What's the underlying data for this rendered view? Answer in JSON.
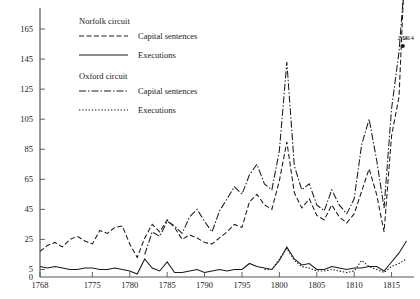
{
  "chart_data": {
    "type": "line",
    "title": "",
    "xlabel": "",
    "ylabel": "",
    "xlim": [
      1768,
      1818
    ],
    "ylim": [
      0,
      175
    ],
    "grid": false,
    "legend_position": "top-left",
    "x_ticks": [
      1768,
      1775,
      1780,
      1785,
      1790,
      1795,
      1800,
      1805,
      1810,
      1815
    ],
    "y_ticks": [
      0,
      5,
      25,
      45,
      65,
      85,
      105,
      125,
      145,
      165
    ],
    "x": [
      1768,
      1769,
      1770,
      1771,
      1772,
      1773,
      1774,
      1775,
      1776,
      1777,
      1778,
      1779,
      1780,
      1781,
      1782,
      1783,
      1784,
      1785,
      1786,
      1787,
      1788,
      1789,
      1790,
      1791,
      1792,
      1793,
      1794,
      1795,
      1796,
      1797,
      1798,
      1799,
      1800,
      1801,
      1802,
      1803,
      1804,
      1805,
      1806,
      1807,
      1808,
      1809,
      1810,
      1811,
      1812,
      1813,
      1814,
      1815,
      1816,
      1817
    ],
    "series": [
      {
        "name": "Capital sentences",
        "circuit": "Norfolk",
        "style": "dashed",
        "values": [
          17,
          21,
          23,
          20,
          25,
          27,
          24,
          22,
          31,
          29,
          33,
          34,
          22,
          13,
          26,
          35,
          30,
          38,
          33,
          25,
          28,
          26,
          23,
          22,
          26,
          30,
          35,
          33,
          50,
          55,
          48,
          45,
          64,
          90,
          56,
          46,
          52,
          41,
          38,
          48,
          40,
          36,
          42,
          57,
          72,
          55,
          30,
          94,
          120,
          234
        ]
      },
      {
        "name": "Executions",
        "circuit": "Norfolk",
        "style": "solid",
        "values": [
          7,
          6,
          7,
          6,
          5,
          5,
          6,
          6,
          5,
          5,
          6,
          5,
          4,
          2,
          12,
          6,
          4,
          10,
          3,
          3,
          4,
          5,
          3,
          4,
          5,
          4,
          5,
          5,
          9,
          7,
          6,
          5,
          11,
          20,
          12,
          8,
          9,
          5,
          5,
          7,
          6,
          5,
          6,
          6,
          7,
          7,
          4,
          10,
          16,
          24
        ]
      },
      {
        "name": "Capital sentences",
        "circuit": "Oxford",
        "style": "dashdot",
        "values": [
          null,
          null,
          null,
          null,
          null,
          null,
          null,
          null,
          null,
          null,
          null,
          null,
          null,
          null,
          15,
          30,
          27,
          37,
          34,
          29,
          40,
          45,
          37,
          30,
          44,
          52,
          60,
          55,
          68,
          75,
          62,
          58,
          84,
          143,
          74,
          58,
          62,
          48,
          44,
          58,
          48,
          42,
          52,
          88,
          105,
          78,
          46,
          112,
          150,
          214
        ]
      },
      {
        "name": "Executions",
        "circuit": "Oxford",
        "style": "dotted",
        "values": [
          null,
          null,
          null,
          null,
          null,
          null,
          null,
          null,
          null,
          null,
          null,
          null,
          null,
          null,
          null,
          null,
          null,
          null,
          null,
          null,
          null,
          null,
          null,
          null,
          null,
          null,
          null,
          null,
          null,
          null,
          5,
          5,
          12,
          19,
          11,
          7,
          6,
          4,
          4,
          5,
          4,
          3,
          4,
          11,
          7,
          5,
          3,
          7,
          9,
          12
        ]
      }
    ],
    "annotations": [
      {
        "label": "234",
        "x": 1816.5,
        "y": 234,
        "series": "Norfolk capital sentences"
      },
      {
        "label": "214",
        "x": 1817.3,
        "y": 214,
        "series": "Oxford capital sentences"
      }
    ]
  },
  "legend": {
    "groups": [
      {
        "title": "Norfolk circuit",
        "entries": [
          {
            "label": "Capital sentences",
            "style": "dashed"
          },
          {
            "label": "Executions",
            "style": "solid"
          }
        ]
      },
      {
        "title": "Oxford circuit",
        "entries": [
          {
            "label": "Capital sentences",
            "style": "dashdot"
          },
          {
            "label": "Executions",
            "style": "dotted"
          }
        ]
      }
    ]
  }
}
